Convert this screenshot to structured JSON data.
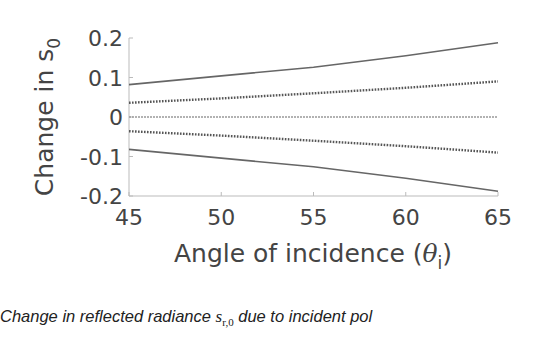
{
  "chart_data": {
    "type": "line",
    "title": "",
    "xlabel": "Angle of incidence (θi)",
    "xlabel_main": "Angle of incidence (",
    "xlabel_symbol": "θ",
    "xlabel_subscript": "i",
    "xlabel_close": ")",
    "ylabel": "Change in s0",
    "ylabel_main": "Change in s",
    "ylabel_subscript": "0",
    "xlim": [
      45,
      65
    ],
    "ylim": [
      -0.2,
      0.2
    ],
    "xticks": [
      45,
      50,
      55,
      60,
      65
    ],
    "xtick_labels": [
      "45",
      "50",
      "55",
      "60",
      "65"
    ],
    "yticks": [
      0.2,
      0.1,
      0,
      -0.1,
      -0.2
    ],
    "ytick_labels": [
      "0.2",
      "0.1",
      "0",
      "-0.1",
      "-0.2"
    ],
    "grid": false,
    "legend": null,
    "x": [
      45,
      50,
      55,
      60,
      65
    ],
    "series": [
      {
        "name": "upper-solid",
        "style": "solid",
        "values": [
          0.082,
          0.104,
          0.126,
          0.155,
          0.188
        ]
      },
      {
        "name": "upper-dotted",
        "style": "dotted",
        "values": [
          0.036,
          0.047,
          0.06,
          0.074,
          0.09
        ]
      },
      {
        "name": "zero",
        "style": "dotted-light",
        "values": [
          0,
          0,
          0,
          0,
          0
        ]
      },
      {
        "name": "lower-dotted",
        "style": "dotted",
        "values": [
          -0.036,
          -0.047,
          -0.06,
          -0.074,
          -0.09
        ]
      },
      {
        "name": "lower-solid",
        "style": "solid",
        "values": [
          -0.082,
          -0.104,
          -0.126,
          -0.155,
          -0.188
        ]
      }
    ],
    "colors": {
      "solid": "#666666",
      "dotted": "#555555",
      "zero": "#999999",
      "axis": "#bbbbbb",
      "text": "#444444"
    }
  },
  "caption": {
    "prefix": "Change in reflected radiance ",
    "math_main": "s",
    "math_subscript": "r,0",
    "suffix": " due to incident pol"
  }
}
